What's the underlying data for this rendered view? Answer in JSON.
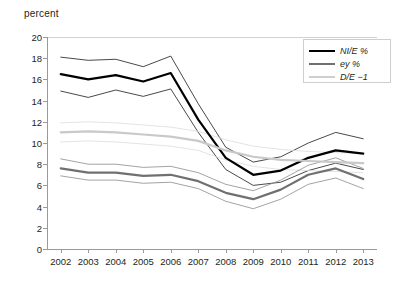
{
  "chart_data": {
    "type": "line",
    "title": "",
    "ylabel": "percent",
    "xlabel": "",
    "ylim": [
      0,
      20
    ],
    "yticks": [
      0,
      2,
      4,
      6,
      8,
      10,
      12,
      14,
      16,
      18,
      20
    ],
    "categories": [
      "2002",
      "2003",
      "2004",
      "2005",
      "2006",
      "2007",
      "2008",
      "2009",
      "2010",
      "2011",
      "2012",
      "2013"
    ],
    "grid": false,
    "legend_position": "top-right",
    "series": [
      {
        "name": "NI/E %",
        "role": "main",
        "color": "#000000",
        "width": 2.2,
        "values": [
          16.5,
          16.0,
          16.4,
          15.8,
          16.6,
          12.2,
          8.6,
          7.0,
          7.4,
          8.6,
          9.3,
          9.0
        ]
      },
      {
        "name": "NI/E % upper",
        "role": "band",
        "color": "#1a1a1a",
        "width": 0.8,
        "values": [
          18.1,
          17.8,
          17.9,
          17.2,
          18.2,
          13.7,
          9.6,
          8.2,
          8.7,
          10.0,
          11.0,
          10.4
        ]
      },
      {
        "name": "NI/E % lower",
        "role": "band",
        "color": "#1a1a1a",
        "width": 0.8,
        "values": [
          14.9,
          14.3,
          15.0,
          14.4,
          15.1,
          11.0,
          7.5,
          6.0,
          6.3,
          7.4,
          8.1,
          7.5
        ]
      },
      {
        "name": "D/E −1",
        "role": "main",
        "color": "#c9c9c9",
        "width": 2.2,
        "values": [
          11.0,
          11.1,
          11.0,
          10.8,
          10.6,
          10.2,
          9.3,
          8.7,
          8.4,
          8.3,
          8.2,
          8.1
        ]
      },
      {
        "name": "D/E −1 upper",
        "role": "band",
        "color": "#dcdcdc",
        "width": 0.8,
        "values": [
          11.9,
          12.0,
          11.9,
          11.7,
          11.5,
          11.1,
          10.3,
          9.7,
          9.4,
          9.2,
          9.1,
          9.0
        ]
      },
      {
        "name": "D/E −1 lower",
        "role": "band",
        "color": "#dcdcdc",
        "width": 0.8,
        "values": [
          10.1,
          10.2,
          10.1,
          9.9,
          9.7,
          9.3,
          8.4,
          7.8,
          7.5,
          7.4,
          7.3,
          7.2
        ]
      },
      {
        "name": "ey %",
        "role": "main",
        "color": "#707070",
        "width": 2.2,
        "values": [
          7.6,
          7.2,
          7.2,
          6.9,
          7.0,
          6.4,
          5.3,
          4.7,
          5.6,
          7.0,
          7.6,
          6.6
        ]
      },
      {
        "name": "ey % upper",
        "role": "band",
        "color": "#8c8c8c",
        "width": 0.8,
        "values": [
          8.5,
          8.0,
          8.0,
          7.7,
          7.8,
          7.2,
          6.1,
          5.5,
          6.5,
          7.9,
          8.6,
          7.6
        ]
      },
      {
        "name": "ey % lower",
        "role": "band",
        "color": "#8c8c8c",
        "width": 0.8,
        "values": [
          6.9,
          6.5,
          6.5,
          6.2,
          6.3,
          5.7,
          4.5,
          3.8,
          4.7,
          6.1,
          6.7,
          5.7
        ]
      }
    ],
    "legend": [
      {
        "label": "NI/E %",
        "color": "#000000",
        "width": 2.6
      },
      {
        "label": "ey %",
        "color": "#707070",
        "width": 2.6
      },
      {
        "label": "D/E −1",
        "color": "#cfcfcf",
        "width": 2.6
      }
    ]
  }
}
